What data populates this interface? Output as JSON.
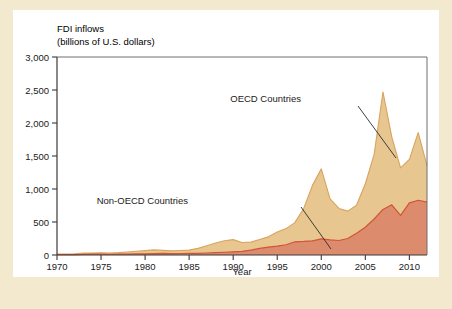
{
  "figure": {
    "background_color": "#f3e9cf",
    "card_color": "#ffffff"
  },
  "chart_data": {
    "type": "area",
    "stacked": true,
    "title": "FDI inflows",
    "subtitle": "(billions of U.S. dollars)",
    "xlabel": "Year",
    "ylabel": "",
    "xlim": [
      1970,
      2012
    ],
    "ylim": [
      0,
      3000
    ],
    "grid": false,
    "legend_position": "inline-annotations",
    "xticks": [
      1970,
      1975,
      1980,
      1985,
      1990,
      1995,
      2000,
      2005,
      2010
    ],
    "xtick_labels": [
      "1970",
      "1975",
      "1980",
      "1985",
      "1990",
      "1995",
      "2000",
      "2005",
      "2010"
    ],
    "yticks": [
      0,
      500,
      1000,
      1500,
      2000,
      2500,
      3000
    ],
    "ytick_labels": [
      "0",
      "500",
      "1,000",
      "1,500",
      "2,000",
      "2,500",
      "3,000"
    ],
    "x": [
      1970,
      1971,
      1972,
      1973,
      1974,
      1975,
      1976,
      1977,
      1978,
      1979,
      1980,
      1981,
      1982,
      1983,
      1984,
      1985,
      1986,
      1987,
      1988,
      1989,
      1990,
      1991,
      1992,
      1993,
      1994,
      1995,
      1996,
      1997,
      1998,
      1999,
      2000,
      2001,
      2002,
      2003,
      2004,
      2005,
      2006,
      2007,
      2008,
      2009,
      2010,
      2011,
      2012
    ],
    "series": [
      {
        "name": "Non-OECD Countries",
        "color": "#dd8b6d",
        "line_color": "#d0553a",
        "values": [
          5,
          6,
          7,
          10,
          12,
          13,
          11,
          12,
          14,
          17,
          18,
          22,
          25,
          22,
          23,
          24,
          25,
          30,
          36,
          42,
          48,
          55,
          75,
          100,
          120,
          135,
          155,
          200,
          205,
          215,
          245,
          230,
          220,
          250,
          330,
          420,
          545,
          690,
          760,
          600,
          790,
          830,
          800
        ]
      },
      {
        "name": "OECD Countries",
        "color": "#e8c690",
        "line_color": "#d8a45f",
        "values": [
          9,
          10,
          12,
          20,
          18,
          22,
          20,
          24,
          32,
          40,
          48,
          55,
          45,
          40,
          45,
          50,
          75,
          110,
          145,
          175,
          185,
          135,
          120,
          135,
          155,
          215,
          245,
          290,
          500,
          840,
          1060,
          620,
          485,
          415,
          425,
          660,
          980,
          1780,
          1030,
          720,
          660,
          1025,
          555
        ]
      }
    ],
    "annotations": [
      {
        "label": "OECD Countries",
        "text_x": 288,
        "text_y": 92,
        "leader_from": [
          345,
          96
        ],
        "leader_to": [
          383,
          148
        ]
      },
      {
        "label": "Non-OECD Countries",
        "text_x": 175,
        "text_y": 194,
        "leader_from": [
          288,
          197
        ],
        "leader_to": [
          318,
          239
        ]
      }
    ]
  }
}
